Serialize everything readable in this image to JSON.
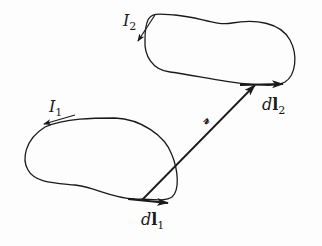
{
  "diagram": {
    "type": "magnetic interaction of two current loops (Biot-Savart / Neumann setup)",
    "colors": {
      "stroke": "#1a1a1a",
      "background": "#fdfdfd"
    },
    "loops": [
      {
        "id": "loop-1",
        "current_label": "I",
        "current_subscript": "1",
        "current_direction": "counterclockwise along top (arrow points left)"
      },
      {
        "id": "loop-2",
        "current_label": "I",
        "current_subscript": "2",
        "current_direction": "down along left side"
      }
    ],
    "elements": [
      {
        "id": "dl1",
        "label_d": "d",
        "label_l": "l",
        "subscript": "1"
      },
      {
        "id": "dl2",
        "label_d": "d",
        "label_l": "l",
        "subscript": "2"
      }
    ],
    "separation_vector": {
      "label": "𝓇",
      "from": "dl1",
      "to": "dl2"
    }
  }
}
